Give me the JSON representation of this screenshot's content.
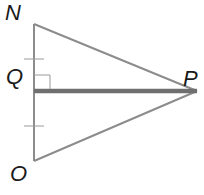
{
  "diagram": {
    "type": "geometry-triangle",
    "colors": {
      "triangle_stroke": "#8c8c8c",
      "segment_stroke": "#6f6f6f",
      "label": "#1a1a1a",
      "background": "#ffffff"
    },
    "points": {
      "N": {
        "label": "N",
        "x": 34,
        "y": 24
      },
      "Q": {
        "label": "Q",
        "x": 34,
        "y": 91
      },
      "O": {
        "label": "O",
        "x": 34,
        "y": 161
      },
      "P": {
        "label": "P",
        "x": 197,
        "y": 91
      }
    },
    "segments": [
      {
        "from": "N",
        "to": "O",
        "style": "thin"
      },
      {
        "from": "N",
        "to": "P",
        "style": "thin"
      },
      {
        "from": "O",
        "to": "P",
        "style": "thin"
      },
      {
        "from": "Q",
        "to": "P",
        "style": "thick"
      }
    ],
    "marks": {
      "congruence_ticks": [
        "NQ",
        "QO"
      ],
      "right_angle_at": "Q"
    }
  }
}
